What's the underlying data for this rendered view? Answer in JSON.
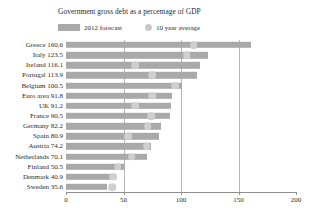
{
  "chart_data": {
    "type": "bar",
    "orientation": "horizontal",
    "title": "Government gross debt as a percentage of GDP",
    "xlabel": "",
    "ylabel": "",
    "xlim": [
      0,
      200
    ],
    "xticks": [
      0,
      50,
      100,
      150,
      200
    ],
    "grid": true,
    "gridlines_at": [
      50,
      100,
      150
    ],
    "legend_position": "top-left",
    "colors": {
      "bar": "#a9a9a9",
      "dot": "#cfcfcf",
      "axis": "#8f8f8f",
      "text": "#2b2b2b",
      "background": "#ffffff"
    },
    "legend": [
      {
        "name": "2012 forecast",
        "marker": "bar",
        "color": "#a9a9a9"
      },
      {
        "name": "10 year average",
        "marker": "circle",
        "color": "#cfcfcf"
      }
    ],
    "categories": [
      "Greece",
      "Italy",
      "Ireland",
      "Portugal",
      "Belgium",
      "Euro area",
      "UK",
      "France",
      "Germany",
      "Spain",
      "Austria",
      "Netherlands",
      "Finland",
      "Denmark",
      "Sweden"
    ],
    "category_labels": [
      "Greece 160.6",
      "Italy 123.5",
      "Ireland 116.1",
      "Portugal 113.9",
      "Belgium 100.5",
      "Euro area 91.8",
      "UK 91.2",
      "France 90.5",
      "Germany 82.2",
      "Spain 80.9",
      "Austria 74.2",
      "Netherlands 70.1",
      "Finland 50.5",
      "Denmark 40.9",
      "Sweden 35.6"
    ],
    "series": [
      {
        "name": "2012 forecast",
        "values": [
          160.6,
          123.5,
          116.1,
          113.9,
          100.5,
          91.8,
          91.2,
          90.5,
          82.2,
          80.9,
          74.2,
          70.1,
          50.5,
          40.9,
          35.6
        ]
      },
      {
        "name": "10 year average",
        "values": [
          111,
          105,
          60,
          75,
          95,
          75,
          60,
          74,
          71,
          54,
          70,
          57,
          45,
          41,
          40
        ]
      }
    ]
  }
}
